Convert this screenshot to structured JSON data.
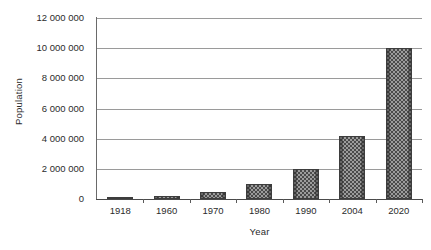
{
  "chart_data": {
    "type": "bar",
    "title": "",
    "xlabel": "Year",
    "ylabel": "Population",
    "categories": [
      "1918",
      "1960",
      "1970",
      "1980",
      "1990",
      "2004",
      "2020"
    ],
    "values": [
      100000,
      200000,
      450000,
      1000000,
      2000000,
      4200000,
      10000000
    ],
    "series": [
      {
        "name": "Population",
        "values": [
          100000,
          200000,
          450000,
          1000000,
          2000000,
          4200000,
          10000000
        ]
      }
    ],
    "ylim": [
      0,
      12000000
    ],
    "ytick_values": [
      0,
      2000000,
      4000000,
      6000000,
      8000000,
      10000000,
      12000000
    ],
    "ytick_labels": [
      "0",
      "2 000 000",
      "4 000 000",
      "6 000 000",
      "8 000 000",
      "10 000 000",
      "12 000 000"
    ],
    "grid": true,
    "grid_axis": "y",
    "legend": false,
    "legend_position": "none",
    "bar_fill": "checkered-gray-pattern",
    "colors": {
      "bar_fill": "#9c9c9c",
      "bar_pattern": "#4a4a4a",
      "bar_border": "#3d3d3d",
      "gridline": "#9a9a9a",
      "axis": "#4a4a4a",
      "text": "#2b2b2b",
      "background": "#ffffff"
    }
  }
}
